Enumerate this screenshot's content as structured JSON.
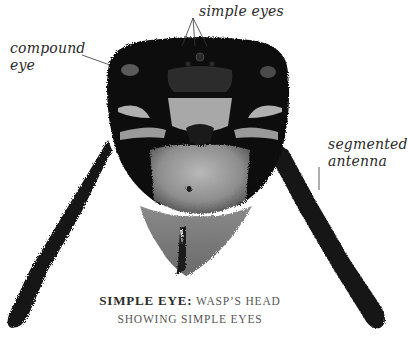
{
  "figure": {
    "labels": [
      {
        "id": "compound-eye",
        "lines": [
          "compound",
          "eye"
        ]
      },
      {
        "id": "simple-eyes",
        "lines": [
          "simple eyes"
        ]
      },
      {
        "id": "segmented-antenna",
        "lines": [
          "segmented",
          "antenna"
        ]
      }
    ],
    "caption": {
      "title": "SIMPLE EYE:",
      "line1_rest": "WASP’S HEAD",
      "line2": "SHOWING SIMPLE EYES"
    }
  },
  "colors": {
    "background": "#ffffff",
    "label_text": "#2a2a2a",
    "caption_text": "#555555",
    "head_dark": "#0d0d0d",
    "face_pale": "#9a9a9a"
  }
}
